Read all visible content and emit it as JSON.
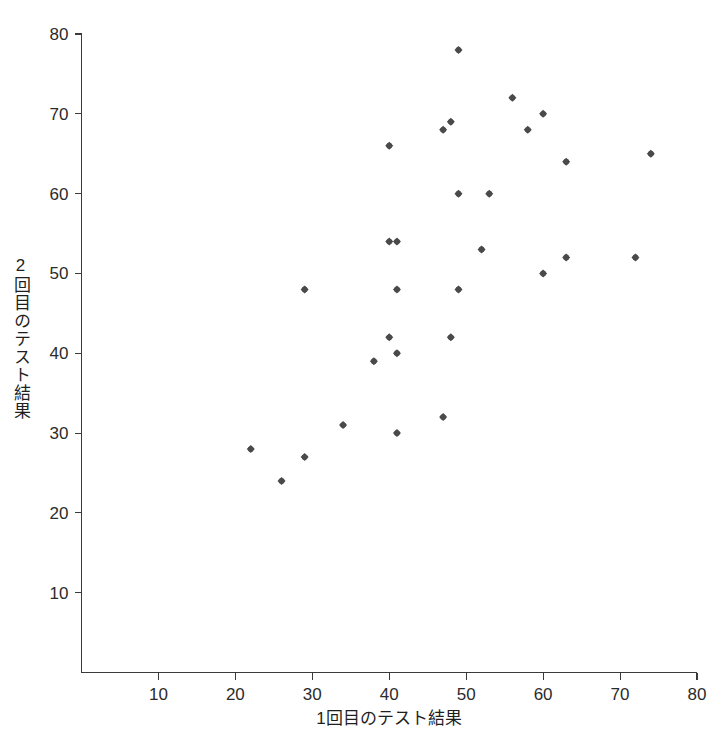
{
  "chart_data": {
    "type": "scatter",
    "title": "",
    "xlabel": "1回目のテスト結果",
    "ylabel": "2回目のテスト結果",
    "xlim": [
      0,
      80
    ],
    "ylim": [
      0,
      80
    ],
    "xticks": [
      10,
      20,
      30,
      40,
      50,
      60,
      70,
      80
    ],
    "yticks": [
      10,
      20,
      30,
      40,
      50,
      60,
      70,
      80
    ],
    "grid": false,
    "legend": null,
    "marker_color": "#4a4a4a",
    "marker_size": 8,
    "points": [
      {
        "x": 22,
        "y": 28
      },
      {
        "x": 26,
        "y": 24
      },
      {
        "x": 29,
        "y": 48
      },
      {
        "x": 29,
        "y": 27
      },
      {
        "x": 34,
        "y": 31
      },
      {
        "x": 38,
        "y": 39
      },
      {
        "x": 40,
        "y": 66
      },
      {
        "x": 40,
        "y": 54
      },
      {
        "x": 41,
        "y": 54
      },
      {
        "x": 40,
        "y": 42
      },
      {
        "x": 41,
        "y": 40
      },
      {
        "x": 41,
        "y": 48
      },
      {
        "x": 41,
        "y": 30
      },
      {
        "x": 47,
        "y": 68
      },
      {
        "x": 47,
        "y": 32
      },
      {
        "x": 48,
        "y": 69
      },
      {
        "x": 48,
        "y": 42
      },
      {
        "x": 49,
        "y": 78
      },
      {
        "x": 49,
        "y": 60
      },
      {
        "x": 49,
        "y": 48
      },
      {
        "x": 52,
        "y": 53
      },
      {
        "x": 53,
        "y": 60
      },
      {
        "x": 56,
        "y": 72
      },
      {
        "x": 58,
        "y": 68
      },
      {
        "x": 60,
        "y": 70
      },
      {
        "x": 60,
        "y": 50
      },
      {
        "x": 63,
        "y": 64
      },
      {
        "x": 63,
        "y": 52
      },
      {
        "x": 72,
        "y": 52
      },
      {
        "x": 74,
        "y": 65
      }
    ]
  },
  "axis": {
    "x_title": "1回目のテスト結果",
    "y_title": "2回目のテスト結果",
    "x_tick_labels": [
      "10",
      "20",
      "30",
      "40",
      "50",
      "60",
      "70",
      "80"
    ],
    "y_tick_labels": [
      "10",
      "20",
      "30",
      "40",
      "50",
      "60",
      "70",
      "80"
    ]
  }
}
